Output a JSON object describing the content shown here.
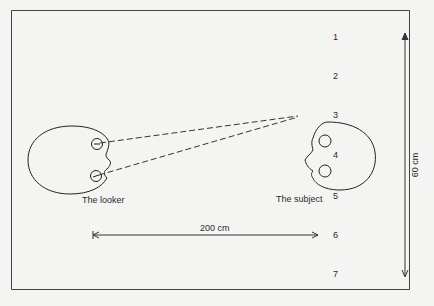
{
  "diagram": {
    "looker_label": "The looker",
    "subject_label": "The subject",
    "distance_label": "200 cm",
    "height_label": "60 cm",
    "positions": [
      "1",
      "2",
      "3",
      "4",
      "5",
      "6",
      "7"
    ]
  },
  "colors": {
    "background": "#f4f4f2",
    "ink": "#2a2a2a"
  }
}
